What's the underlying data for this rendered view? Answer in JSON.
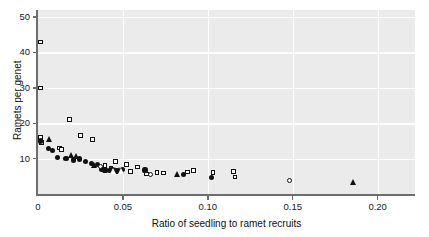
{
  "chart_data": {
    "type": "scatter",
    "title": "",
    "xlabel": "Ratio of seedling to ramet recruits",
    "ylabel": "Ramets per genet",
    "xlim": [
      0,
      0.222
    ],
    "ylim": [
      0,
      52
    ],
    "xticks": [
      0,
      0.05,
      0.1,
      0.15,
      0.2
    ],
    "xticklabels": [
      "0",
      "0.05",
      "0.10",
      "0.15",
      "0.20"
    ],
    "yticks": [
      10,
      20,
      30,
      40,
      50
    ],
    "yticklabels": [
      "10",
      "20",
      "30",
      "40",
      "50"
    ],
    "grid": true,
    "grid_color": "#ffffff",
    "panel_color": "#ebebeb",
    "legend": "none",
    "series": [
      {
        "name": "open-square",
        "marker": "square-open",
        "points": [
          [
            0.0015,
            43.0
          ],
          [
            0.0015,
            30.0
          ],
          [
            0.0015,
            16.0
          ],
          [
            0.002,
            14.6
          ],
          [
            0.0125,
            13.0
          ],
          [
            0.014,
            12.6
          ],
          [
            0.0185,
            21.0
          ],
          [
            0.025,
            16.5
          ],
          [
            0.032,
            15.4
          ],
          [
            0.0395,
            8.0
          ],
          [
            0.043,
            7.2
          ],
          [
            0.0455,
            9.2
          ],
          [
            0.052,
            8.4
          ],
          [
            0.0545,
            6.3
          ],
          [
            0.0585,
            7.6
          ],
          [
            0.064,
            5.6
          ],
          [
            0.07,
            6.0
          ],
          [
            0.074,
            5.9
          ],
          [
            0.088,
            6.2
          ],
          [
            0.0915,
            6.6
          ],
          [
            0.103,
            6.0
          ],
          [
            0.115,
            6.4
          ],
          [
            0.116,
            4.8
          ]
        ]
      },
      {
        "name": "filled-circle",
        "marker": "circle-filled",
        "points": [
          [
            0.0015,
            15.0
          ],
          [
            0.006,
            12.8
          ],
          [
            0.0085,
            12.2
          ],
          [
            0.0115,
            10.4
          ],
          [
            0.0165,
            10.1
          ],
          [
            0.021,
            9.6
          ],
          [
            0.0245,
            9.9
          ],
          [
            0.028,
            9.2
          ],
          [
            0.0315,
            8.6
          ],
          [
            0.035,
            8.4
          ],
          [
            0.0375,
            7.0
          ],
          [
            0.0395,
            6.8
          ],
          [
            0.042,
            6.6
          ],
          [
            0.044,
            6.9
          ],
          [
            0.0465,
            6.5
          ],
          [
            0.05,
            7.0
          ],
          [
            0.063,
            6.8
          ],
          [
            0.0855,
            5.6
          ],
          [
            0.102,
            4.6
          ]
        ]
      },
      {
        "name": "filled-triangle",
        "marker": "triangle-filled",
        "points": [
          [
            0.007,
            15.4
          ],
          [
            0.02,
            11.0
          ],
          [
            0.0225,
            10.6
          ],
          [
            0.033,
            8.2
          ],
          [
            0.043,
            7.0
          ],
          [
            0.0455,
            6.8
          ],
          [
            0.048,
            6.9
          ],
          [
            0.082,
            5.6
          ],
          [
            0.1855,
            3.4
          ]
        ]
      },
      {
        "name": "open-circle",
        "marker": "circle-open",
        "points": [
          [
            0.037,
            7.8
          ],
          [
            0.0665,
            5.4
          ],
          [
            0.148,
            3.8
          ]
        ]
      },
      {
        "name": "open-triangle",
        "marker": "triangle-open",
        "points": [
          [
            0.0445,
            6.6
          ],
          [
            0.049,
            6.5
          ]
        ]
      }
    ]
  }
}
